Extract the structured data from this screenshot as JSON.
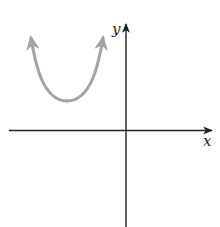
{
  "diagram": {
    "type": "coordinate-plane-sketch",
    "axes": {
      "x_label": "x",
      "y_label": "y",
      "color": "#222222"
    },
    "curve": {
      "kind": "upward-opening parabola",
      "location": "second quadrant (vertex above x-axis, left of y-axis)",
      "color": "#a3a3a3",
      "arrows_on_both_ends": true
    }
  }
}
